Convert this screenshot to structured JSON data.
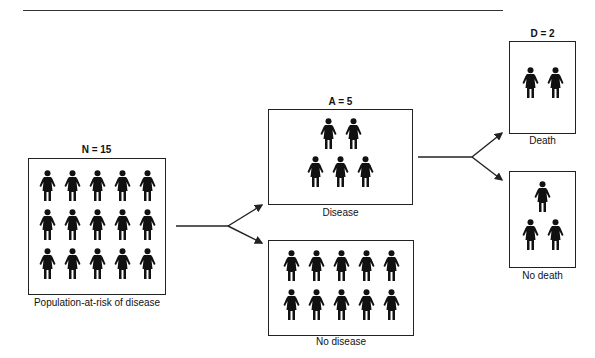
{
  "diagram": {
    "population": {
      "title": "N = 15",
      "label": "Population-at-risk of disease",
      "count": 15,
      "rows": [
        5,
        5,
        5
      ]
    },
    "disease": {
      "title": "A = 5",
      "label": "Disease",
      "count": 5,
      "rows": [
        2,
        3
      ]
    },
    "no_disease": {
      "label": "No disease",
      "count": 10,
      "rows": [
        5,
        5
      ]
    },
    "death": {
      "title": "D = 2",
      "label": "Death",
      "count": 2,
      "rows": [
        2
      ]
    },
    "no_death": {
      "label": "No death",
      "count": 3,
      "rows": [
        1,
        2
      ]
    }
  },
  "icon": "person-figure-icon"
}
